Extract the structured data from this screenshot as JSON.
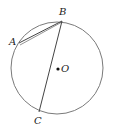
{
  "diagram": {
    "type": "circle-geometry",
    "circle": {
      "center_label": "O",
      "cx": 57,
      "cy": 68,
      "r": 46,
      "stroke": "#7a7a7a"
    },
    "points": [
      {
        "label": "A",
        "x": 19,
        "y": 43
      },
      {
        "label": "B",
        "x": 62,
        "y": 21
      },
      {
        "label": "C",
        "x": 39,
        "y": 112
      }
    ],
    "segments": [
      {
        "from": "A",
        "to": "B"
      },
      {
        "from": "B",
        "to": "C"
      }
    ],
    "labels": {
      "A": "A",
      "B": "B",
      "C": "C",
      "O": "O"
    }
  }
}
